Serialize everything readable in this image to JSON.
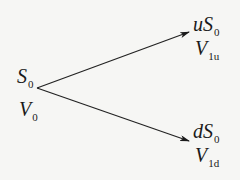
{
  "diagram": {
    "type": "binomial-tree",
    "root": {
      "price": {
        "base": "S",
        "sub": "0"
      },
      "value": {
        "base": "V",
        "sub": "0"
      }
    },
    "up": {
      "price": {
        "base": "uS",
        "sub": "0"
      },
      "value": {
        "base": "V",
        "sub": "1u"
      }
    },
    "down": {
      "price": {
        "base": "dS",
        "sub": "0"
      },
      "value": {
        "base": "V",
        "sub": "1d"
      }
    },
    "line_color": "#222222"
  }
}
